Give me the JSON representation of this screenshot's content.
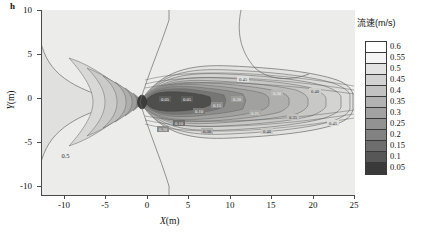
{
  "figure": {
    "corner_label": "h"
  },
  "axes": {
    "x": {
      "title_var": "X",
      "title_unit": "(m)",
      "ticks": [
        -10,
        -5,
        0,
        5,
        10,
        15,
        20,
        25
      ],
      "tick_labels": [
        "-10",
        "-5",
        "0",
        "5",
        "10",
        "15",
        "20",
        "25"
      ],
      "min": -12.8,
      "max": 25.0
    },
    "y": {
      "title_var": "Y",
      "title_unit": "(m)",
      "ticks": [
        10,
        5,
        0,
        -5,
        -10
      ],
      "tick_labels": [
        "10",
        "5",
        "0",
        "-5",
        "-10"
      ],
      "min": -10.8,
      "max": 10.0
    }
  },
  "legend": {
    "title": "流速(m/s)",
    "levels": [
      {
        "value": "0.6",
        "color": "#ffffff"
      },
      {
        "value": "0.55",
        "color": "#f4f4f4"
      },
      {
        "value": "0.5",
        "color": "#e3e3e3"
      },
      {
        "value": "0.45",
        "color": "#d2d2d2"
      },
      {
        "value": "0.4",
        "color": "#c2c2c2"
      },
      {
        "value": "0.35",
        "color": "#b2b2b2"
      },
      {
        "value": "0.3",
        "color": "#a2a2a2"
      },
      {
        "value": "0.25",
        "color": "#929292"
      },
      {
        "value": "0.2",
        "color": "#828282"
      },
      {
        "value": "0.15",
        "color": "#6e6e6e"
      },
      {
        "value": "0.1",
        "color": "#575757"
      },
      {
        "value": "0.05",
        "color": "#3a3a3a"
      }
    ]
  },
  "chart_data": {
    "type": "contour",
    "title": "",
    "xlabel": "X(m)",
    "ylabel": "Y(m)",
    "legend_title": "流速(m/s)",
    "legend_position": "right",
    "grid": false,
    "xlim": [
      -12.8,
      25.0
    ],
    "ylim": [
      -10.8,
      10.0
    ],
    "xticks": [
      -10,
      -5,
      0,
      5,
      10,
      15,
      20,
      25
    ],
    "yticks": [
      -10,
      -5,
      0,
      5,
      10,
      15,
      20,
      25
    ],
    "colormap": "grayscale-discrete",
    "contour_levels": [
      0.05,
      0.1,
      0.15,
      0.2,
      0.25,
      0.3,
      0.35,
      0.4,
      0.45,
      0.5,
      0.55,
      0.6
    ],
    "level_colors": [
      "#3a3a3a",
      "#575757",
      "#6e6e6e",
      "#828282",
      "#929292",
      "#a2a2a2",
      "#b2b2b2",
      "#c2c2c2",
      "#d2d2d2",
      "#e3e3e3",
      "#f4f4f4",
      "#ffffff"
    ],
    "background_value": 0.5,
    "inline_labels": [
      "0.5"
    ],
    "obstacle": {
      "x": 0,
      "y": 0,
      "radius": 0.9
    },
    "wake": {
      "x_start": 0,
      "x_end": 22.5,
      "half_width_max": 2.6,
      "core_min_value": 0.05
    },
    "stagnation_contour": {
      "level": 0.5,
      "x_extent": [
        -12.8,
        0.3
      ],
      "y_extent": [
        -5.2,
        5.2
      ]
    }
  }
}
